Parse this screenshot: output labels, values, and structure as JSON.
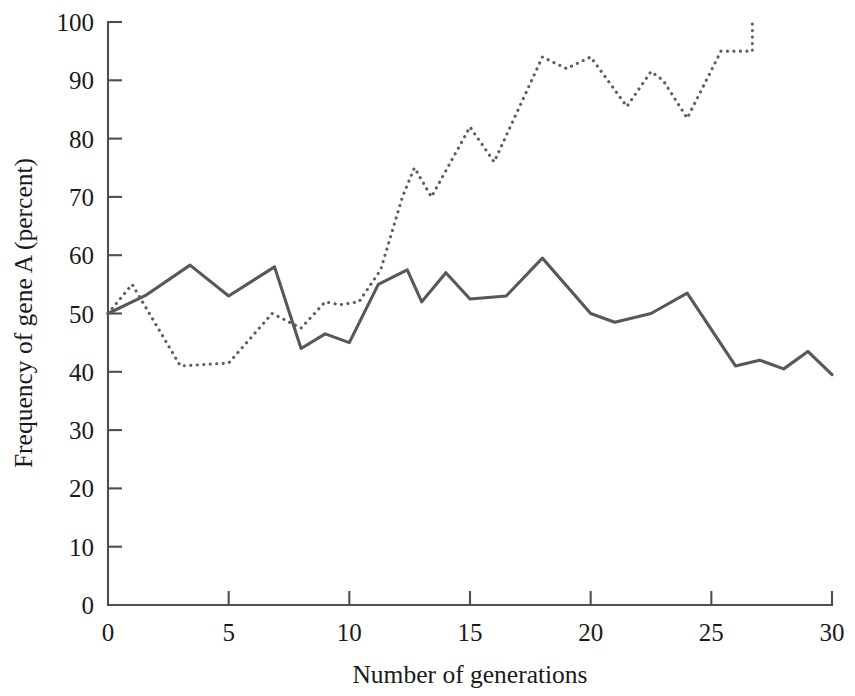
{
  "chart_data": {
    "type": "line",
    "title": "",
    "xlabel": "Number of generations",
    "ylabel": "Frequency of gene A (percent)",
    "xlim": [
      0,
      30
    ],
    "ylim": [
      0,
      100
    ],
    "xticks": [
      0,
      5,
      10,
      15,
      20,
      25,
      30
    ],
    "yticks": [
      0,
      10,
      20,
      30,
      40,
      50,
      60,
      70,
      80,
      90,
      100
    ],
    "xtick_labels": [
      "0",
      "5",
      "10",
      "15",
      "20",
      "25",
      "30"
    ],
    "ytick_labels": [
      "0",
      "10",
      "20",
      "30",
      "40",
      "50",
      "60",
      "70",
      "80",
      "90",
      "100"
    ],
    "grid": false,
    "legend": "none",
    "series": [
      {
        "name": "population-solid",
        "style": "solid",
        "color": "#57575c",
        "points": [
          [
            0.0,
            50.0
          ],
          [
            1.0,
            52.0
          ],
          [
            1.6,
            53.2
          ],
          [
            3.4,
            58.3
          ],
          [
            5.0,
            53.0
          ],
          [
            6.9,
            58.0
          ],
          [
            8.0,
            44.0
          ],
          [
            9.0,
            46.5
          ],
          [
            10.0,
            45.0
          ],
          [
            11.2,
            55.0
          ],
          [
            12.4,
            57.5
          ],
          [
            13.0,
            52.0
          ],
          [
            14.0,
            57.0
          ],
          [
            15.0,
            52.5
          ],
          [
            16.5,
            53.0
          ],
          [
            18.0,
            59.5
          ],
          [
            20.0,
            50.0
          ],
          [
            21.0,
            48.5
          ],
          [
            22.5,
            50.0
          ],
          [
            24.0,
            53.5
          ],
          [
            26.0,
            41.0
          ],
          [
            27.0,
            42.0
          ],
          [
            28.0,
            40.5
          ],
          [
            29.0,
            43.5
          ],
          [
            30.0,
            39.5
          ]
        ]
      },
      {
        "name": "population-dotted",
        "style": "dotted",
        "color": "#5d5d63",
        "points": [
          [
            0.0,
            50.0
          ],
          [
            1.0,
            55.0
          ],
          [
            3.0,
            41.0
          ],
          [
            5.0,
            41.5
          ],
          [
            6.8,
            50.0
          ],
          [
            8.0,
            47.5
          ],
          [
            9.0,
            52.0
          ],
          [
            9.6,
            51.5
          ],
          [
            10.4,
            52.0
          ],
          [
            11.3,
            57.5
          ],
          [
            12.2,
            70.0
          ],
          [
            12.7,
            75.0
          ],
          [
            13.4,
            70.0
          ],
          [
            15.0,
            82.0
          ],
          [
            16.0,
            76.0
          ],
          [
            18.0,
            94.0
          ],
          [
            19.0,
            92.0
          ],
          [
            20.0,
            94.0
          ],
          [
            21.5,
            85.5
          ],
          [
            22.5,
            91.5
          ],
          [
            23.0,
            90.0
          ],
          [
            24.0,
            83.5
          ],
          [
            25.4,
            95.0
          ],
          [
            26.7,
            95.0
          ],
          [
            26.7,
            100.0
          ]
        ]
      }
    ]
  }
}
